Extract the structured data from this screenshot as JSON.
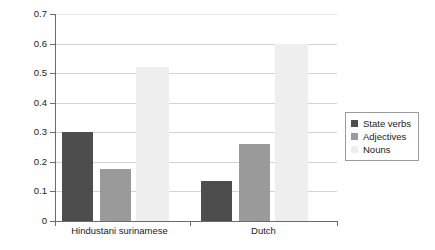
{
  "chart_data": {
    "type": "bar",
    "title": "",
    "xlabel": "",
    "ylabel": "",
    "ylim": [
      0,
      0.7
    ],
    "grid": true,
    "legend_position": "right",
    "categories": [
      "Hindustani surinamese",
      "Dutch"
    ],
    "ytick_labels": [
      "0.7",
      "0.6",
      "0.5",
      "0.4",
      "0.3",
      "0.2",
      "0.1",
      "0"
    ],
    "ytick_values": [
      0.7,
      0.6,
      0.5,
      0.4,
      0.3,
      0.2,
      0.1,
      0
    ],
    "series": [
      {
        "name": "State verbs",
        "color": "#4d4d4d",
        "values": [
          0.3,
          0.135
        ]
      },
      {
        "name": "Adjectives",
        "color": "#9a9a9a",
        "values": [
          0.175,
          0.26
        ]
      },
      {
        "name": "Nouns",
        "color": "#eeeeee",
        "values": [
          0.52,
          0.6
        ]
      }
    ]
  },
  "legend": {
    "items": [
      {
        "label": "State verbs",
        "swatch": "state"
      },
      {
        "label": "Adjectives",
        "swatch": "adj"
      },
      {
        "label": "Nouns",
        "swatch": "nouns"
      }
    ]
  },
  "axis": {
    "y_labels": [
      "0.7",
      "0.6",
      "0.5",
      "0.4",
      "0.3",
      "0.2",
      "0.1",
      "0"
    ],
    "x_labels": [
      "Hindustani surinamese",
      "Dutch"
    ]
  }
}
